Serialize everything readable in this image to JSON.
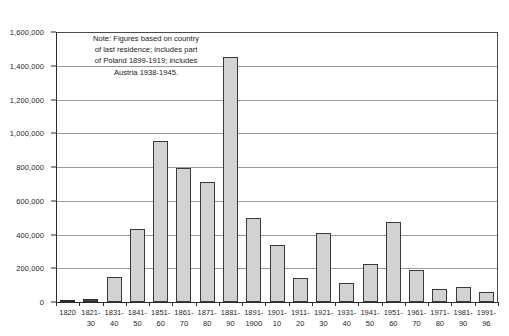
{
  "chart_data": {
    "type": "bar",
    "title": "",
    "subtitle": "",
    "xlabel": "",
    "ylabel": "",
    "ylim": [
      0,
      1600000
    ],
    "ytick_step": 200000,
    "grid": true,
    "legend": false,
    "categories": [
      "1820",
      "1821-\n30",
      "1831-\n40",
      "1841-\n50",
      "1851-\n60",
      "1861-\n70",
      "1871-\n80",
      "1881-\n90",
      "1891-\n1900",
      "1901-\n10",
      "1911-\n20",
      "1921-\n30",
      "1931-\n40",
      "1941-\n50",
      "1951-\n60",
      "1961-\n70",
      "1971-\n80",
      "1981-\n90",
      "1991-\n96"
    ],
    "values": [
      8000,
      15000,
      150000,
      435000,
      955000,
      795000,
      710000,
      1450000,
      500000,
      340000,
      145000,
      410000,
      115000,
      225000,
      475000,
      190000,
      75000,
      90000,
      60000
    ],
    "ytick_labels": [
      "0",
      "200,000",
      "400,000",
      "600,000",
      "800,000",
      "1,000,000",
      "1,200,000",
      "1,400,000",
      "1,600,000"
    ],
    "ytick_values": [
      0,
      200000,
      400000,
      600000,
      800000,
      1000000,
      1200000,
      1400000,
      1600000
    ],
    "annotations": [
      {
        "name": "note",
        "lines": [
          "Note: Figures based on country",
          "of last residence; includes part",
          "of Poland 1899-1919; includes",
          "Austria 1938-1945."
        ]
      }
    ],
    "colors": {
      "bar_fill": "#d2d2d2",
      "bar_stroke": "#3a3a3a",
      "gridline": "#9a9a9a",
      "axis": "#2b2b2b",
      "text": "#1a1a1a",
      "background": "#ffffff"
    }
  }
}
